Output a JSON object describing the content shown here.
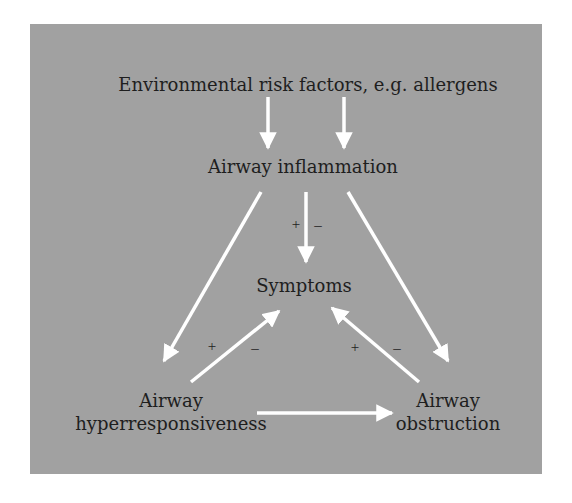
{
  "diagram": {
    "colors": {
      "background": "#a1a1a1",
      "arrow": "#ffffff",
      "text": "#1e1e1e"
    },
    "nodes": {
      "environment": "Environmental risk factors, e.g. allergens",
      "inflammation": "Airway inflammation",
      "symptoms": "Symptoms",
      "hyper_line1": "Airway",
      "hyper_line2": "hyperresponsiveness",
      "obstruction_line1": "Airway",
      "obstruction_line2": "obstruction"
    },
    "signs": {
      "center_plus": "+",
      "center_minus": "–",
      "left_plus": "+",
      "left_minus": "–",
      "right_plus": "+",
      "right_minus": "–"
    },
    "edges": [
      {
        "from": "environment",
        "to": "inflammation",
        "count": 2
      },
      {
        "from": "inflammation",
        "to": "symptoms",
        "label": "+ –"
      },
      {
        "from": "inflammation",
        "to": "hyperresponsiveness"
      },
      {
        "from": "inflammation",
        "to": "obstruction"
      },
      {
        "from": "hyperresponsiveness",
        "to": "symptoms",
        "label": "+ –"
      },
      {
        "from": "obstruction",
        "to": "symptoms",
        "label": "+ –"
      },
      {
        "from": "hyperresponsiveness",
        "to": "obstruction"
      }
    ]
  }
}
